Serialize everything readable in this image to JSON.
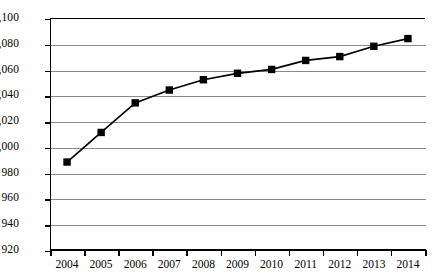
{
  "chart_data": {
    "type": "line",
    "title": "",
    "subtitle": "",
    "xlabel": "",
    "ylabel": "",
    "categories": [
      "2004",
      "2005",
      "2006",
      "2007",
      "2008",
      "2009",
      "2010",
      "2011",
      "2012",
      "2013",
      "2014"
    ],
    "values": [
      988,
      1011,
      1034,
      1044,
      1052,
      1057,
      1060,
      1067,
      1070,
      1078,
      1084
    ],
    "series": [
      {
        "name": "",
        "values": [
          988,
          1011,
          1034,
          1044,
          1052,
          1057,
          1060,
          1067,
          1070,
          1078,
          1084
        ]
      }
    ],
    "ylim": [
      920,
      1100
    ],
    "ytick_step": 20,
    "ytick_labels": [
      "1,100",
      "1,080",
      "1,060",
      "1,040",
      "1,020",
      "1,000",
      "980",
      "960",
      "940",
      "920"
    ],
    "ytick_values": [
      1100,
      1080,
      1060,
      1040,
      1020,
      1000,
      980,
      960,
      940,
      920
    ],
    "grid": true,
    "grid_axis": "y",
    "legend": false,
    "legend_position": "none",
    "annotations": [],
    "marker_style": "square",
    "line_color": "#000000",
    "marker_color": "#000000",
    "grid_color": "#8a8a8a",
    "axis_color": "#000000",
    "background_color": "#ffffff"
  }
}
